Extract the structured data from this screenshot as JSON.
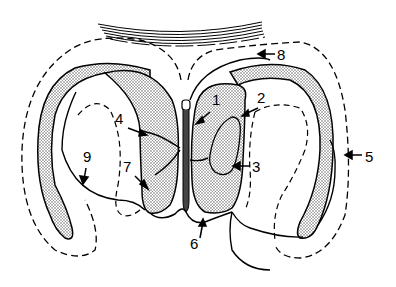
{
  "diagram": {
    "type": "anatomical line drawing",
    "colors": {
      "ink": "#000000",
      "background": "#ffffff",
      "stipple": "#9a9a9a"
    },
    "labels": [
      {
        "id": "1",
        "text": "1",
        "x": 212,
        "y": 105
      },
      {
        "id": "2",
        "text": "2",
        "x": 257,
        "y": 103
      },
      {
        "id": "3",
        "text": "3",
        "x": 252,
        "y": 172
      },
      {
        "id": "4",
        "text": "4",
        "x": 115,
        "y": 124
      },
      {
        "id": "5",
        "text": "5",
        "x": 365,
        "y": 162
      },
      {
        "id": "6",
        "text": "6",
        "x": 190,
        "y": 249
      },
      {
        "id": "7",
        "text": "7",
        "x": 123,
        "y": 172
      },
      {
        "id": "8",
        "text": "8",
        "x": 277,
        "y": 60
      },
      {
        "id": "9",
        "text": "9",
        "x": 83,
        "y": 162
      }
    ]
  }
}
